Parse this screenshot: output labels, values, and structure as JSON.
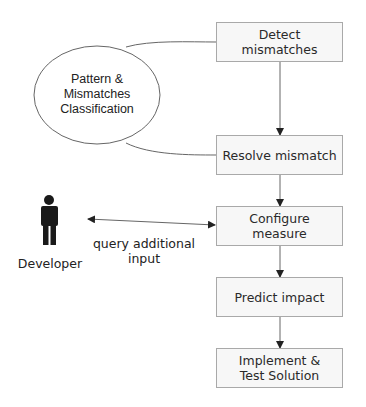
{
  "diagram": {
    "steps": [
      {
        "id": "detect",
        "label": "Detect\nmismatches"
      },
      {
        "id": "resolve",
        "label": "Resolve mismatch"
      },
      {
        "id": "configure",
        "label": "Configure\nmeasure"
      },
      {
        "id": "predict",
        "label": "Predict impact"
      },
      {
        "id": "implement",
        "label": "Implement &\nTest Solution"
      }
    ],
    "classification": {
      "label": "Pattern &\nMismatches\nClassification"
    },
    "actor": {
      "label": "Developer",
      "icon": "person-icon"
    },
    "interaction": {
      "label": "query additional\ninput"
    },
    "colors": {
      "box_border": "#a9a9a9",
      "box_fill": "#f7f7f7",
      "line": "#555555",
      "text": "#2a2a2a",
      "actor": "#1a1a1a"
    }
  }
}
